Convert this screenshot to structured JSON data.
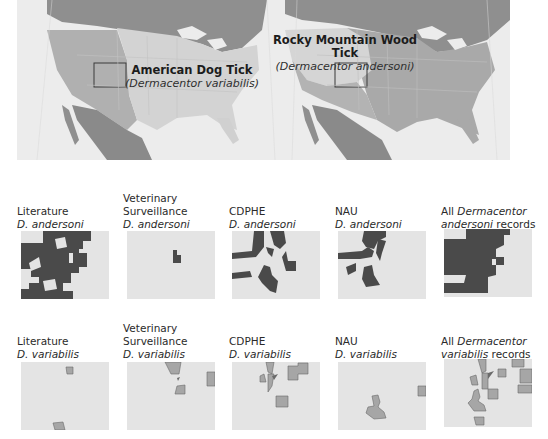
{
  "figure": {
    "top_maps": [
      {
        "name": "american-dog-tick-map",
        "common_name": "American Dog Tick",
        "scientific_name": "(Dermacentor variabilis)"
      },
      {
        "name": "rocky-mountain-wood-tick-map",
        "common_name": "Rocky Mountain Wood Tick",
        "scientific_name": "(Dermacentor andersoni)"
      }
    ],
    "rows": [
      {
        "species": "D. andersoni",
        "panels": [
          {
            "line1": "Literature",
            "line2": "D. andersoni",
            "line3": ""
          },
          {
            "line1": "Veterinary",
            "line2": "Surveillance",
            "line3": "D. andersoni"
          },
          {
            "line1": "CDPHE",
            "line2": "D. andersoni",
            "line3": ""
          },
          {
            "line1": "NAU",
            "line2": "D. andersoni",
            "line3": ""
          },
          {
            "line1_pre": "All ",
            "line1_italic": "Dermacentor",
            "line2_italic": "andersoni",
            "line2_post": " records"
          }
        ]
      },
      {
        "species": "D. variabilis",
        "panels": [
          {
            "line1": "Literature",
            "line2": "D. variabilis",
            "line3": ""
          },
          {
            "line1": "Veterinary",
            "line2": "Surveillance",
            "line3": "D. variabilis"
          },
          {
            "line1": "CDPHE",
            "line2": "D. variabilis",
            "line3": ""
          },
          {
            "line1": "NAU",
            "line2": "D. variabilis",
            "line3": ""
          },
          {
            "line1_pre": "All ",
            "line1_italic": "Dermacentor",
            "line2_italic": "variabilis",
            "line2_post": " records"
          }
        ]
      }
    ],
    "colors": {
      "andersoni_fill": "#4a4a4a",
      "variabilis_fill": "#a6a6a6",
      "panel_bg": "#e4e4e4",
      "range_light": "#cfcfcf",
      "range_mid": "#b5b5b5",
      "land_dark": "#8f8f8f",
      "ocean": "#ececec"
    }
  }
}
